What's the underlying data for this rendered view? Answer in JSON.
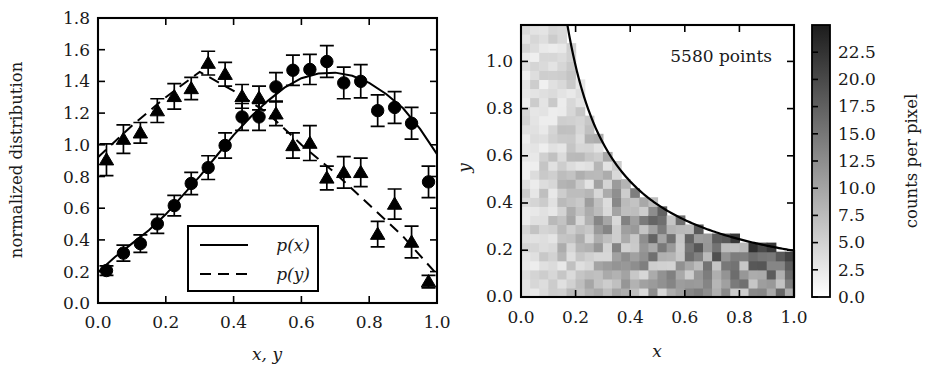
{
  "figure": {
    "background": "#ffffff",
    "ink": "#000000"
  },
  "left_panel": {
    "ylabel": "normalized distribution",
    "xlabel": "x, y",
    "legend": {
      "entries": [
        {
          "label": "p(x)",
          "style": "solid",
          "marker": "circle"
        },
        {
          "label": "p(y)",
          "style": "dashed",
          "marker": "triangle"
        }
      ]
    }
  },
  "right_panel": {
    "xlabel": "x",
    "ylabel": "y",
    "annotation": "5580 points",
    "colorbar_label": "counts per pixel"
  },
  "chart_data": [
    {
      "type": "scatter",
      "id": "left-distributions",
      "title": "",
      "xlabel": "x, y",
      "ylabel": "normalized distribution",
      "xlim": [
        0.0,
        1.0
      ],
      "ylim": [
        0.0,
        1.8
      ],
      "xticks": [
        0.0,
        0.2,
        0.4,
        0.6,
        0.8,
        1.0
      ],
      "xticklabels": [
        "0.0",
        "0.2",
        "0.4",
        "0.6",
        "0.8",
        "1.0"
      ],
      "yticks": [
        0.0,
        0.2,
        0.4,
        0.6,
        0.8,
        1.0,
        1.2,
        1.4,
        1.6,
        1.8
      ],
      "yticklabels": [
        "0.0",
        "0.2",
        "0.4",
        "0.6",
        "0.8",
        "1.0",
        "1.2",
        "1.4",
        "1.6",
        "1.8"
      ],
      "grid": false,
      "legend_position": "lower center",
      "series": [
        {
          "name": "p(x)",
          "marker": "circle",
          "linestyle": "solid",
          "x": [
            0.025,
            0.075,
            0.125,
            0.175,
            0.225,
            0.275,
            0.325,
            0.375,
            0.425,
            0.475,
            0.525,
            0.575,
            0.625,
            0.675,
            0.725,
            0.775,
            0.825,
            0.875,
            0.925,
            0.975
          ],
          "values": [
            0.205,
            0.315,
            0.375,
            0.5,
            0.615,
            0.755,
            0.855,
            0.995,
            1.175,
            1.175,
            1.365,
            1.47,
            1.475,
            1.525,
            1.39,
            1.4,
            1.215,
            1.235,
            1.135,
            0.765
          ],
          "errors": [
            0.03,
            0.05,
            0.055,
            0.06,
            0.065,
            0.07,
            0.075,
            0.08,
            0.085,
            0.085,
            0.09,
            0.095,
            0.095,
            0.1,
            0.1,
            0.105,
            0.1,
            0.1,
            0.1,
            0.1
          ]
        },
        {
          "name": "p(y)",
          "marker": "triangle",
          "linestyle": "dashed",
          "x": [
            0.025,
            0.075,
            0.125,
            0.175,
            0.225,
            0.275,
            0.325,
            0.375,
            0.425,
            0.475,
            0.525,
            0.575,
            0.625,
            0.675,
            0.725,
            0.775,
            0.825,
            0.875,
            0.925,
            0.975
          ],
          "values": [
            0.905,
            1.035,
            1.075,
            1.215,
            1.305,
            1.355,
            1.515,
            1.445,
            1.305,
            1.295,
            1.195,
            0.995,
            1.01,
            0.79,
            0.825,
            0.825,
            0.435,
            0.625,
            0.385,
            0.135
          ],
          "errors": [
            0.1,
            0.09,
            0.065,
            0.075,
            0.08,
            0.07,
            0.075,
            0.075,
            0.075,
            0.075,
            0.075,
            0.08,
            0.11,
            0.075,
            0.1,
            0.09,
            0.08,
            0.095,
            0.1,
            0.04
          ]
        }
      ],
      "fit_curves": [
        {
          "name": "p(x)",
          "linestyle": "solid",
          "x": [
            0.0,
            0.05,
            0.1,
            0.15,
            0.2,
            0.25,
            0.3,
            0.35,
            0.4,
            0.45,
            0.5,
            0.55,
            0.6,
            0.65,
            0.7,
            0.75,
            0.8,
            0.85,
            0.9,
            0.95,
            1.0
          ],
          "y": [
            0.195,
            0.29,
            0.375,
            0.46,
            0.56,
            0.68,
            0.8,
            0.93,
            1.06,
            1.175,
            1.275,
            1.36,
            1.42,
            1.45,
            1.455,
            1.435,
            1.39,
            1.32,
            1.23,
            1.1,
            0.94
          ]
        },
        {
          "name": "p(y)",
          "linestyle": "dashed",
          "x": [
            0.0,
            0.1,
            0.2,
            0.3,
            0.4,
            0.5,
            0.6,
            0.7,
            0.8,
            0.9,
            1.0
          ],
          "y": [
            0.92,
            1.12,
            1.3,
            1.46,
            1.34,
            1.2,
            1.0,
            0.82,
            0.62,
            0.42,
            0.18
          ]
        }
      ]
    },
    {
      "type": "heatmap",
      "id": "right-density",
      "title": "",
      "xlabel": "x",
      "ylabel": "y",
      "annotation": "5580 points",
      "xlim": [
        0.0,
        1.0
      ],
      "ylim": [
        0.0,
        1.0
      ],
      "xticks": [
        0.0,
        0.2,
        0.4,
        0.6,
        0.8,
        1.0
      ],
      "xticklabels": [
        "0.0",
        "0.2",
        "0.4",
        "0.6",
        "0.8",
        "1.0"
      ],
      "yticks": [
        0.0,
        0.2,
        0.4,
        0.6,
        0.8,
        1.0
      ],
      "yticklabels": [
        "0.0",
        "0.2",
        "0.4",
        "0.6",
        "0.8",
        "1.0"
      ],
      "grid": false,
      "nbins_x": 30,
      "nbins_y": 30,
      "total_points": 5580,
      "colormap": "grayscale_white_to_black",
      "colorbar": {
        "label": "counts per pixel",
        "vmin": 0.0,
        "vmax": 25.0,
        "ticks": [
          0.0,
          2.5,
          5.0,
          7.5,
          10.0,
          12.5,
          15.0,
          17.5,
          20.0,
          22.5
        ],
        "ticklabels": [
          "0.0",
          "2.5",
          "5.0",
          "7.5",
          "10.0",
          "12.5",
          "15.0",
          "17.5",
          "20.0",
          "22.5"
        ],
        "position": "right"
      },
      "boundary_curve": {
        "description": "flat at y=1 until x=0.17, then hyperbolic decay to y=0.17 at x=1.0",
        "flat_until_x": 0.17,
        "constant": 0.17,
        "end_y": 0.17
      }
    }
  ]
}
